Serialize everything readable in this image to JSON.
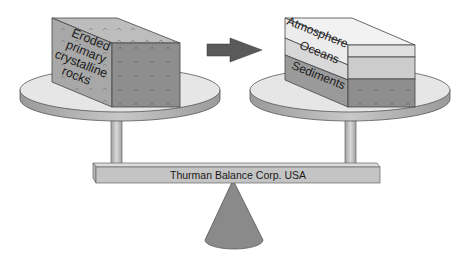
{
  "diagram": {
    "left_block": {
      "label_lines": [
        "Eroded",
        "primary",
        "crystalline",
        "rocks"
      ]
    },
    "arrow": {
      "direction": "right"
    },
    "right_block": {
      "layers": [
        {
          "label": "Atmosphere",
          "color": "#ececec"
        },
        {
          "label": "Oceans",
          "color": "#d8d8d8"
        },
        {
          "label": "Sediments",
          "color": "#9a9a9a"
        }
      ]
    },
    "beam_label": "Thurman Balance Corp.  USA",
    "colors": {
      "plate_top": "#e6e6e6",
      "plate_rim": "#b0b0b0",
      "rock_side": "#a8a8a8",
      "rock_front": "#8e8e8e",
      "rock_top": "#bdbdbd",
      "arrow": "#5a5a5a",
      "beam": "#c4c4c4",
      "fulcrum": "#8a8a8a"
    }
  }
}
